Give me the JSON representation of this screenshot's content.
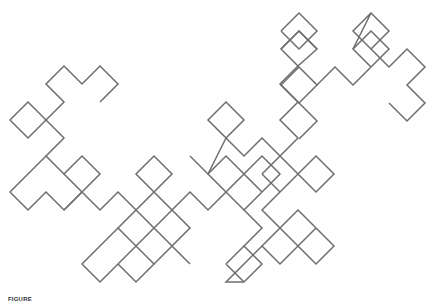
{
  "figure": {
    "stroke_color": "#6e6e6e",
    "lattice_step_px": 18,
    "paths": [
      [
        [
          100,
          102
        ],
        [
          118,
          84
        ],
        [
          100,
          66
        ],
        [
          82,
          84
        ],
        [
          64,
          66
        ],
        [
          46,
          84
        ],
        [
          64,
          102
        ],
        [
          46,
          120
        ],
        [
          28,
          102
        ],
        [
          10,
          120
        ],
        [
          28,
          138
        ],
        [
          46,
          120
        ],
        [
          64,
          138
        ],
        [
          46,
          156
        ],
        [
          64,
          174
        ]
      ],
      [
        [
          46,
          156
        ],
        [
          28,
          174
        ],
        [
          10,
          192
        ],
        [
          28,
          210
        ],
        [
          46,
          192
        ],
        [
          64,
          210
        ],
        [
          82,
          192
        ],
        [
          64,
          174
        ],
        [
          82,
          156
        ],
        [
          100,
          174
        ],
        [
          82,
          192
        ],
        [
          100,
          210
        ],
        [
          118,
          192
        ],
        [
          136,
          210
        ],
        [
          118,
          228
        ],
        [
          136,
          246
        ],
        [
          154,
          228
        ],
        [
          136,
          210
        ]
      ],
      [
        [
          82,
          192
        ],
        [
          64,
          210
        ]
      ],
      [
        [
          118,
          228
        ],
        [
          100,
          246
        ],
        [
          82,
          264
        ],
        [
          100,
          282
        ],
        [
          118,
          264
        ],
        [
          136,
          282
        ],
        [
          154,
          264
        ],
        [
          136,
          246
        ],
        [
          118,
          264
        ]
      ],
      [
        [
          154,
          228
        ],
        [
          172,
          246
        ],
        [
          154,
          264
        ]
      ],
      [
        [
          136,
          210
        ],
        [
          154,
          192
        ],
        [
          136,
          174
        ],
        [
          154,
          156
        ],
        [
          172,
          174
        ],
        [
          154,
          192
        ],
        [
          172,
          210
        ],
        [
          154,
          228
        ]
      ],
      [
        [
          172,
          210
        ],
        [
          190,
          228
        ],
        [
          172,
          246
        ],
        [
          190,
          264
        ]
      ],
      [
        [
          172,
          210
        ],
        [
          190,
          192
        ],
        [
          208,
          210
        ],
        [
          226,
          192
        ],
        [
          208,
          174
        ],
        [
          226,
          156
        ],
        [
          244,
          174
        ],
        [
          226,
          192
        ],
        [
          244,
          210
        ],
        [
          262,
          192
        ],
        [
          244,
          174
        ],
        [
          262,
          156
        ],
        [
          280,
          174
        ],
        [
          262,
          192
        ]
      ],
      [
        [
          208,
          174
        ],
        [
          226,
          138
        ],
        [
          208,
          120
        ],
        [
          226,
          102
        ],
        [
          244,
          120
        ],
        [
          226,
          138
        ],
        [
          244,
          156
        ],
        [
          262,
          138
        ],
        [
          280,
          156
        ],
        [
          262,
          174
        ]
      ],
      [
        [
          208,
          174
        ],
        [
          190,
          156
        ]
      ],
      [
        [
          280,
          156
        ],
        [
          298,
          138
        ],
        [
          280,
          120
        ],
        [
          298,
          102
        ],
        [
          280,
          84
        ],
        [
          298,
          66
        ]
      ],
      [
        [
          280,
          156
        ],
        [
          298,
          174
        ],
        [
          280,
          192
        ],
        [
          262,
          210
        ],
        [
          280,
          228
        ],
        [
          262,
          246
        ],
        [
          280,
          264
        ],
        [
          298,
          246
        ],
        [
          316,
          264
        ],
        [
          334,
          246
        ],
        [
          316,
          228
        ],
        [
          298,
          246
        ],
        [
          280,
          228
        ],
        [
          298,
          210
        ],
        [
          316,
          228
        ]
      ],
      [
        [
          280,
          192
        ],
        [
          262,
          174
        ]
      ],
      [
        [
          298,
          174
        ],
        [
          316,
          156
        ],
        [
          334,
          174
        ],
        [
          316,
          192
        ],
        [
          298,
          174
        ]
      ],
      [
        [
          262,
          246
        ],
        [
          244,
          264
        ],
        [
          226,
          282
        ],
        [
          244,
          282
        ]
      ],
      [
        [
          226,
          264
        ],
        [
          244,
          246
        ],
        [
          262,
          264
        ],
        [
          244,
          282
        ],
        [
          226,
          264
        ]
      ],
      [
        [
          244,
          246
        ],
        [
          262,
          228
        ],
        [
          244,
          210
        ]
      ],
      [
        [
          298,
          66
        ],
        [
          317,
          49
        ],
        [
          299,
          31
        ],
        [
          281,
          49
        ],
        [
          299,
          67
        ],
        [
          317,
          85
        ],
        [
          299,
          103
        ],
        [
          281,
          85
        ],
        [
          299,
          67
        ]
      ],
      [
        [
          281,
          49
        ],
        [
          299,
          31
        ],
        [
          317,
          49
        ]
      ],
      [
        [
          281,
          31
        ],
        [
          299,
          13
        ],
        [
          317,
          31
        ],
        [
          299,
          49
        ],
        [
          281,
          31
        ]
      ],
      [
        [
          317,
          85
        ],
        [
          335,
          67
        ],
        [
          353,
          85
        ],
        [
          371,
          67
        ],
        [
          353,
          49
        ],
        [
          371,
          31
        ],
        [
          389,
          49
        ],
        [
          371,
          67
        ]
      ],
      [
        [
          353,
          49
        ],
        [
          371,
          13
        ],
        [
          389,
          31
        ],
        [
          371,
          49
        ],
        [
          353,
          31
        ],
        [
          371,
          13
        ]
      ],
      [
        [
          371,
          49
        ],
        [
          389,
          67
        ],
        [
          407,
          49
        ],
        [
          425,
          67
        ],
        [
          407,
          85
        ],
        [
          425,
          103
        ],
        [
          407,
          121
        ],
        [
          389,
          103
        ]
      ],
      [
        [
          299,
          103
        ],
        [
          317,
          121
        ],
        [
          299,
          139
        ]
      ]
    ]
  },
  "caption": {
    "label": "FIGURE",
    "text": "Dragon curve fractal (caption cropped)"
  }
}
